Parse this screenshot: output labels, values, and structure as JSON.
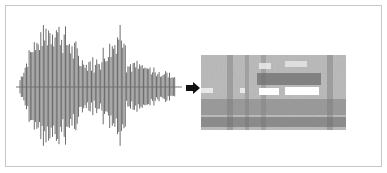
{
  "diagram": {
    "nodes": [
      {
        "id": "waveform",
        "kind": "audio-waveform"
      },
      {
        "id": "spectrogram",
        "kind": "spectrogram-image"
      }
    ],
    "edges": [
      {
        "from": "waveform",
        "to": "spectrogram",
        "icon": "arrow-right-icon"
      }
    ],
    "colors": {
      "frame_border": "#c8c8c8",
      "waveform": "#6e6e6e",
      "arrow": "#111111",
      "spectrogram_base": "#a8a8a8"
    }
  }
}
